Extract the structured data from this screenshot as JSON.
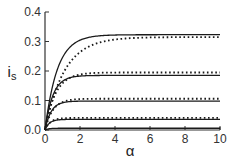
{
  "chart_data": {
    "type": "line",
    "title": "",
    "xlabel": "α",
    "ylabel": "i_s",
    "xlim": [
      0,
      10
    ],
    "ylim": [
      0,
      0.4
    ],
    "x_ticks": [
      "0",
      "2",
      "4",
      "6",
      "8",
      "10"
    ],
    "y_ticks": [
      "0.0",
      "0.1",
      "0.2",
      "0.3",
      "0.4"
    ],
    "grid": false,
    "legend": null,
    "x": [
      0,
      0.25,
      0.5,
      1,
      1.5,
      2,
      3,
      4,
      5,
      6,
      7,
      8,
      9,
      10
    ],
    "series": [
      {
        "name": "solid-1",
        "style": "solid",
        "plateau": 0.323,
        "tau": 0.7,
        "values": [
          0,
          0.097,
          0.165,
          0.246,
          0.286,
          0.305,
          0.319,
          0.322,
          0.323,
          0.323,
          0.323,
          0.323,
          0.323,
          0.323
        ]
      },
      {
        "name": "dotted-1",
        "style": "dotted",
        "plateau": 0.315,
        "tau": 1.1,
        "values": [
          0,
          0.064,
          0.115,
          0.187,
          0.235,
          0.264,
          0.294,
          0.306,
          0.311,
          0.313,
          0.314,
          0.315,
          0.315,
          0.315
        ]
      },
      {
        "name": "solid-2",
        "style": "solid",
        "plateau": 0.185,
        "tau": 0.45,
        "values": [
          0,
          0.079,
          0.124,
          0.165,
          0.178,
          0.183,
          0.185,
          0.185,
          0.185,
          0.185,
          0.185,
          0.185,
          0.185,
          0.185
        ]
      },
      {
        "name": "dotted-2",
        "style": "dotted",
        "plateau": 0.195,
        "tau": 0.6,
        "values": [
          0,
          0.067,
          0.111,
          0.159,
          0.18,
          0.189,
          0.194,
          0.195,
          0.195,
          0.195,
          0.195,
          0.195,
          0.195,
          0.195
        ]
      },
      {
        "name": "solid-3",
        "style": "solid",
        "plateau": 0.098,
        "tau": 0.35,
        "values": [
          0,
          0.05,
          0.074,
          0.093,
          0.097,
          0.098,
          0.098,
          0.098,
          0.098,
          0.098,
          0.098,
          0.098,
          0.098,
          0.098
        ]
      },
      {
        "name": "dotted-3",
        "style": "dotted",
        "plateau": 0.106,
        "tau": 0.45,
        "values": [
          0,
          0.045,
          0.071,
          0.095,
          0.103,
          0.105,
          0.106,
          0.106,
          0.106,
          0.106,
          0.106,
          0.106,
          0.106,
          0.106
        ]
      },
      {
        "name": "solid-4",
        "style": "solid",
        "plateau": 0.036,
        "tau": 0.25,
        "values": [
          0,
          0.023,
          0.031,
          0.035,
          0.036,
          0.036,
          0.036,
          0.036,
          0.036,
          0.036,
          0.036,
          0.036,
          0.036,
          0.036
        ]
      },
      {
        "name": "dotted-4",
        "style": "dotted",
        "plateau": 0.041,
        "tau": 0.3,
        "values": [
          0,
          0.023,
          0.033,
          0.039,
          0.04,
          0.041,
          0.041,
          0.041,
          0.041,
          0.041,
          0.041,
          0.041,
          0.041,
          0.041
        ]
      },
      {
        "name": "solid-5",
        "style": "solid",
        "plateau": 0.006,
        "tau": 0.2,
        "values": [
          0,
          0.004,
          0.006,
          0.006,
          0.006,
          0.006,
          0.006,
          0.006,
          0.006,
          0.006,
          0.006,
          0.006,
          0.006,
          0.006
        ]
      }
    ]
  },
  "colors": {
    "line": "#1a1a1a",
    "axis": "#333333",
    "background": "#ffffff"
  }
}
